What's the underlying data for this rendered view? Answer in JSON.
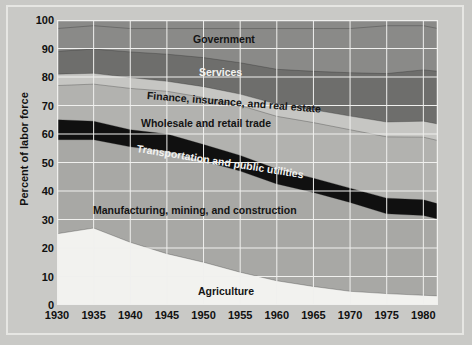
{
  "chart": {
    "type": "area",
    "ylabel": "Percent of labor force",
    "xlabel": "",
    "title": ""
  },
  "axes": {
    "y_ticks": [
      "100",
      "90",
      "80",
      "70",
      "60",
      "50",
      "40",
      "30",
      "20",
      "10",
      "0"
    ],
    "x_ticks": [
      "1930",
      "1935",
      "1940",
      "1945",
      "1950",
      "1955",
      "1960",
      "1965",
      "1970",
      "1975",
      "1980"
    ]
  },
  "labels": {
    "government": "Government",
    "services": "Services",
    "finance": "Finance, insurance, and real estate",
    "wholesale": "Wholesale and retail trade",
    "transportation": "Transportation and public utilities",
    "manufacturing": "Manufacturing, mining, and construction",
    "agriculture": "Agriculture"
  },
  "colors": {
    "background": "#c9c9c6",
    "plot_background": "#b7b7b4",
    "gridline": "#f0f0ee",
    "frame": "#e6e6e3",
    "agriculture": "#f2f2ef",
    "manufacturing": "#a8a8a5",
    "transportation": "#101010",
    "wholesale": "#b2b2af",
    "finance": "#c6c6c3",
    "services": "#6e6e6c",
    "government": "#8a8a88",
    "text_dark": "#101010",
    "text_light": "#f2f2f0"
  },
  "chart_data": {
    "type": "area",
    "stacked": true,
    "title": "",
    "xlabel": "",
    "ylabel": "Percent of labor force",
    "xlim": [
      1930,
      1982
    ],
    "ylim": [
      0,
      100
    ],
    "grid": true,
    "legend": "in-plot labels",
    "x": [
      1930,
      1935,
      1940,
      1945,
      1950,
      1955,
      1960,
      1965,
      1970,
      1975,
      1980,
      1982
    ],
    "series": [
      {
        "name": "Agriculture",
        "values": [
          25.0,
          27.0,
          22.0,
          18.0,
          15.0,
          11.5,
          8.5,
          6.5,
          4.8,
          4.0,
          3.4,
          3.2
        ]
      },
      {
        "name": "Manufacturing, mining, and construction",
        "values": [
          33.0,
          31.0,
          33.5,
          36.0,
          35.5,
          35.5,
          34.0,
          33.0,
          31.2,
          28.0,
          28.0,
          27.0
        ]
      },
      {
        "name": "Transportation and public utilities",
        "values": [
          7.0,
          6.5,
          6.0,
          6.0,
          5.8,
          5.5,
          5.2,
          5.0,
          5.0,
          5.5,
          5.5,
          5.3
        ]
      },
      {
        "name": "Wholesale and retail trade",
        "values": [
          12.0,
          13.0,
          14.5,
          15.0,
          16.5,
          17.5,
          18.5,
          19.5,
          20.5,
          21.5,
          22.0,
          22.2
        ]
      },
      {
        "name": "Finance, insurance, and real estate",
        "values": [
          4.0,
          3.8,
          3.8,
          3.5,
          3.8,
          4.0,
          4.3,
          4.5,
          4.8,
          5.2,
          5.6,
          5.8
        ]
      },
      {
        "name": "Services",
        "values": [
          8.0,
          8.5,
          9.0,
          9.5,
          10.2,
          11.0,
          12.2,
          13.5,
          15.2,
          17.0,
          18.0,
          18.5
        ]
      },
      {
        "name": "Government",
        "values": [
          8.0,
          8.2,
          8.2,
          9.0,
          10.2,
          12.0,
          14.3,
          15.0,
          15.5,
          16.8,
          15.5,
          15.0
        ]
      }
    ],
    "cumulative_tops": {
      "agriculture": [
        25.0,
        27.0,
        22.0,
        18.0,
        15.0,
        11.5,
        8.5,
        6.5,
        4.8,
        4.0,
        3.4,
        3.2
      ],
      "manufacturing": [
        58.0,
        58.0,
        55.5,
        54.0,
        50.5,
        47.0,
        42.5,
        39.5,
        36.0,
        32.0,
        31.4,
        30.2
      ],
      "transportation": [
        65.0,
        64.5,
        61.5,
        60.0,
        56.3,
        52.5,
        47.7,
        44.5,
        41.0,
        37.5,
        36.9,
        35.5
      ],
      "wholesale": [
        77.0,
        77.5,
        76.0,
        75.0,
        72.8,
        70.0,
        66.2,
        64.0,
        61.5,
        59.0,
        58.9,
        57.7
      ],
      "finance": [
        81.0,
        81.3,
        79.8,
        78.5,
        76.6,
        74.0,
        70.5,
        68.5,
        66.3,
        64.2,
        64.5,
        63.5
      ],
      "services": [
        89.0,
        89.8,
        88.8,
        88.0,
        86.8,
        85.0,
        82.7,
        82.0,
        81.5,
        81.2,
        82.5,
        82.0
      ],
      "government": [
        97.0,
        98.0,
        97.0,
        97.0,
        97.0,
        97.0,
        97.0,
        97.0,
        97.0,
        98.0,
        98.0,
        97.0
      ]
    }
  }
}
